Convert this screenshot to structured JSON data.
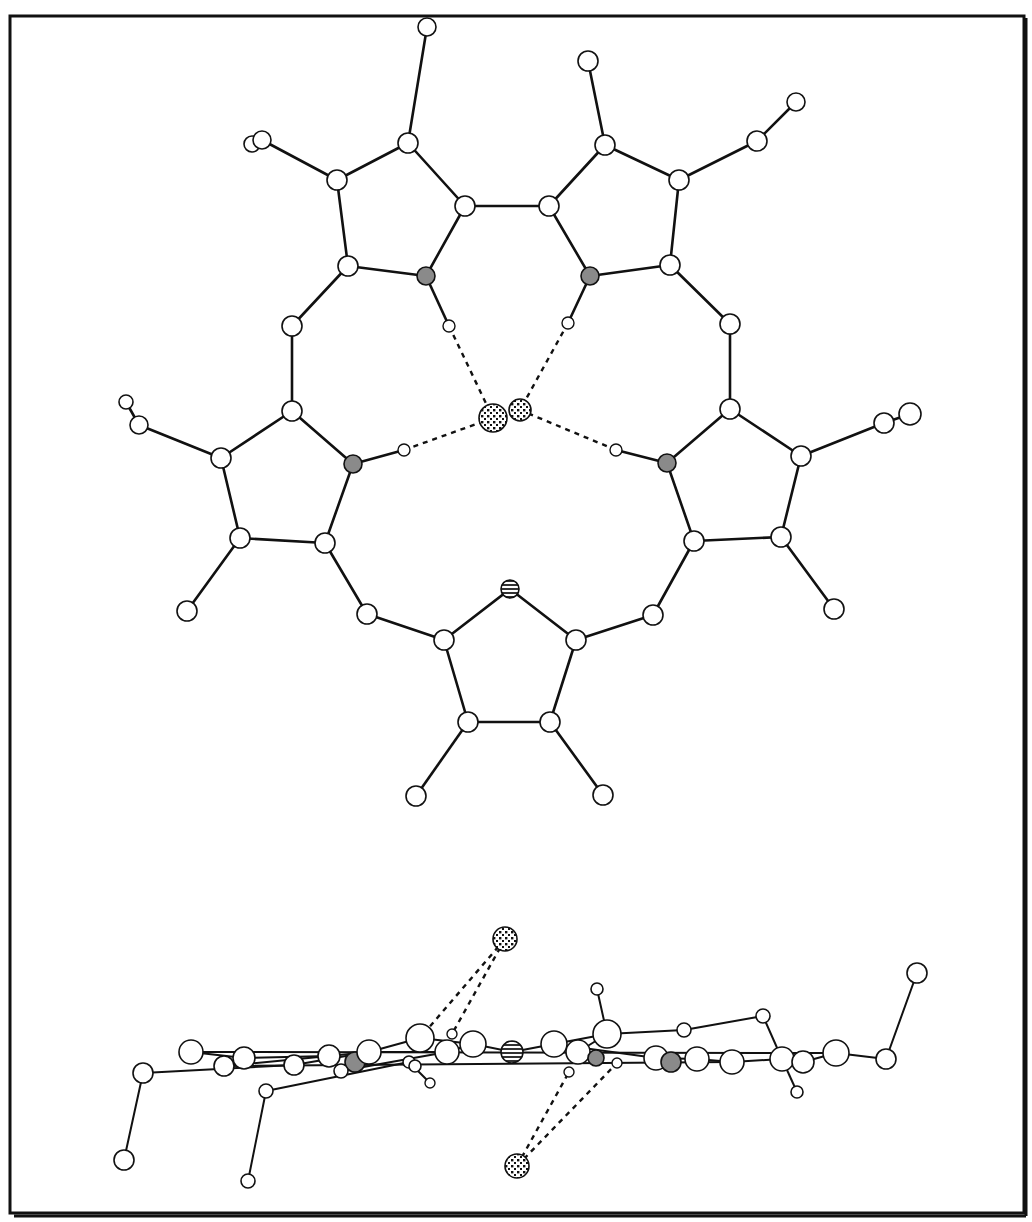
{
  "figure": {
    "title": "",
    "colors": {
      "background": "#ffffff",
      "line": "#111111",
      "nitrogen_fill": "#8a8a8a",
      "carbon_fill": "#ffffff"
    },
    "legend": {
      "atom_types": [
        {
          "key": "C",
          "style": "open circle"
        },
        {
          "key": "H",
          "style": "small open circle"
        },
        {
          "key": "N",
          "style": "grey filled circle"
        },
        {
          "key": "S",
          "style": "horizontal hatched circle"
        },
        {
          "key": "X",
          "style": "dotted circle (anion)"
        }
      ]
    }
  },
  "views": {
    "top": {
      "label": "top view",
      "atoms": [
        {
          "id": "a1",
          "t": "C",
          "x": 427,
          "y": 27,
          "r": 9
        },
        {
          "id": "a2",
          "t": "C",
          "x": 252,
          "y": 144,
          "r": 8
        },
        {
          "id": "a3",
          "t": "C",
          "x": 262,
          "y": 140,
          "r": 9
        },
        {
          "id": "a4",
          "t": "C",
          "x": 408,
          "y": 143,
          "r": 10
        },
        {
          "id": "a5",
          "t": "C",
          "x": 337,
          "y": 180,
          "r": 10
        },
        {
          "id": "a6",
          "t": "C",
          "x": 465,
          "y": 206,
          "r": 10
        },
        {
          "id": "a7",
          "t": "C",
          "x": 348,
          "y": 266,
          "r": 10
        },
        {
          "id": "a8",
          "t": "N",
          "x": 426,
          "y": 276,
          "r": 9
        },
        {
          "id": "a9",
          "t": "H",
          "x": 449,
          "y": 326,
          "r": 6
        },
        {
          "id": "b1",
          "t": "C",
          "x": 588,
          "y": 61,
          "r": 10
        },
        {
          "id": "b2",
          "t": "C",
          "x": 605,
          "y": 145,
          "r": 10
        },
        {
          "id": "b3",
          "t": "C",
          "x": 679,
          "y": 180,
          "r": 10
        },
        {
          "id": "b4",
          "t": "C",
          "x": 757,
          "y": 141,
          "r": 10
        },
        {
          "id": "b5",
          "t": "C",
          "x": 796,
          "y": 102,
          "r": 9
        },
        {
          "id": "b6",
          "t": "C",
          "x": 549,
          "y": 206,
          "r": 10
        },
        {
          "id": "b7",
          "t": "C",
          "x": 670,
          "y": 265,
          "r": 10
        },
        {
          "id": "b8",
          "t": "N",
          "x": 590,
          "y": 276,
          "r": 9
        },
        {
          "id": "b9",
          "t": "H",
          "x": 568,
          "y": 323,
          "r": 6
        },
        {
          "id": "c1",
          "t": "C",
          "x": 292,
          "y": 326,
          "r": 10
        },
        {
          "id": "c2",
          "t": "C",
          "x": 292,
          "y": 411,
          "r": 10
        },
        {
          "id": "c3",
          "t": "C",
          "x": 221,
          "y": 458,
          "r": 10
        },
        {
          "id": "c4",
          "t": "C",
          "x": 139,
          "y": 425,
          "r": 9
        },
        {
          "id": "c5",
          "t": "C",
          "x": 126,
          "y": 402,
          "r": 7
        },
        {
          "id": "c6",
          "t": "N",
          "x": 353,
          "y": 464,
          "r": 9
        },
        {
          "id": "c7",
          "t": "H",
          "x": 404,
          "y": 450,
          "r": 6
        },
        {
          "id": "c8",
          "t": "C",
          "x": 240,
          "y": 538,
          "r": 10
        },
        {
          "id": "c9",
          "t": "C",
          "x": 325,
          "y": 543,
          "r": 10
        },
        {
          "id": "c10",
          "t": "C",
          "x": 187,
          "y": 611,
          "r": 10
        },
        {
          "id": "c11",
          "t": "C",
          "x": 367,
          "y": 614,
          "r": 10
        },
        {
          "id": "d1",
          "t": "C",
          "x": 730,
          "y": 324,
          "r": 10
        },
        {
          "id": "d2",
          "t": "C",
          "x": 730,
          "y": 409,
          "r": 10
        },
        {
          "id": "d3",
          "t": "C",
          "x": 801,
          "y": 456,
          "r": 10
        },
        {
          "id": "d4",
          "t": "C",
          "x": 884,
          "y": 423,
          "r": 10
        },
        {
          "id": "d5",
          "t": "C",
          "x": 910,
          "y": 414,
          "r": 11
        },
        {
          "id": "d6",
          "t": "N",
          "x": 667,
          "y": 463,
          "r": 9
        },
        {
          "id": "d7",
          "t": "H",
          "x": 616,
          "y": 450,
          "r": 6
        },
        {
          "id": "d8",
          "t": "C",
          "x": 694,
          "y": 541,
          "r": 10
        },
        {
          "id": "d9",
          "t": "C",
          "x": 781,
          "y": 537,
          "r": 10
        },
        {
          "id": "d10",
          "t": "C",
          "x": 834,
          "y": 609,
          "r": 10
        },
        {
          "id": "d11",
          "t": "C",
          "x": 653,
          "y": 615,
          "r": 10
        },
        {
          "id": "e1",
          "t": "S",
          "x": 510,
          "y": 589,
          "r": 9
        },
        {
          "id": "e2",
          "t": "C",
          "x": 444,
          "y": 640,
          "r": 10
        },
        {
          "id": "e3",
          "t": "C",
          "x": 576,
          "y": 640,
          "r": 10
        },
        {
          "id": "e4",
          "t": "C",
          "x": 468,
          "y": 722,
          "r": 10
        },
        {
          "id": "e5",
          "t": "C",
          "x": 550,
          "y": 722,
          "r": 10
        },
        {
          "id": "e6",
          "t": "C",
          "x": 416,
          "y": 796,
          "r": 10
        },
        {
          "id": "e7",
          "t": "C",
          "x": 603,
          "y": 795,
          "r": 10
        },
        {
          "id": "x1",
          "t": "X",
          "x": 493,
          "y": 418,
          "r": 14
        },
        {
          "id": "x2",
          "t": "X",
          "x": 520,
          "y": 410,
          "r": 11
        }
      ],
      "bonds": [
        [
          "a1",
          "a4"
        ],
        [
          "a2",
          "a3"
        ],
        [
          "a3",
          "a5"
        ],
        [
          "a4",
          "a5"
        ],
        [
          "a4",
          "a6"
        ],
        [
          "a5",
          "a7"
        ],
        [
          "a7",
          "a8"
        ],
        [
          "a8",
          "a6"
        ],
        [
          "a8",
          "a9"
        ],
        [
          "a6",
          "b6"
        ],
        [
          "b1",
          "b2"
        ],
        [
          "b2",
          "b6"
        ],
        [
          "b2",
          "b3"
        ],
        [
          "b3",
          "b4"
        ],
        [
          "b4",
          "b5"
        ],
        [
          "b3",
          "b7"
        ],
        [
          "b7",
          "b8"
        ],
        [
          "b8",
          "b6"
        ],
        [
          "b8",
          "b9"
        ],
        [
          "a7",
          "c1"
        ],
        [
          "c1",
          "c2"
        ],
        [
          "c2",
          "c3"
        ],
        [
          "c3",
          "c4"
        ],
        [
          "c4",
          "c5"
        ],
        [
          "c2",
          "c6"
        ],
        [
          "c6",
          "c7"
        ],
        [
          "c3",
          "c8"
        ],
        [
          "c8",
          "c9"
        ],
        [
          "c9",
          "c6"
        ],
        [
          "c8",
          "c10"
        ],
        [
          "c9",
          "c11"
        ],
        [
          "b7",
          "d1"
        ],
        [
          "d1",
          "d2"
        ],
        [
          "d2",
          "d3"
        ],
        [
          "d3",
          "d4"
        ],
        [
          "d4",
          "d5"
        ],
        [
          "d2",
          "d6"
        ],
        [
          "d6",
          "d7"
        ],
        [
          "d3",
          "d9"
        ],
        [
          "d9",
          "d8"
        ],
        [
          "d8",
          "d6"
        ],
        [
          "d9",
          "d10"
        ],
        [
          "d8",
          "d11"
        ],
        [
          "c11",
          "e2"
        ],
        [
          "d11",
          "e3"
        ],
        [
          "e1",
          "e2"
        ],
        [
          "e1",
          "e3"
        ],
        [
          "e2",
          "e4"
        ],
        [
          "e3",
          "e5"
        ],
        [
          "e4",
          "e5"
        ],
        [
          "e4",
          "e6"
        ],
        [
          "e5",
          "e7"
        ]
      ],
      "hbonds": [
        [
          "a9",
          "x1"
        ],
        [
          "b9",
          "x2"
        ],
        [
          "c7",
          "x1"
        ],
        [
          "d7",
          "x2"
        ]
      ]
    },
    "side": {
      "label": "side view",
      "atoms": [
        {
          "id": "s1",
          "t": "C",
          "x": 124,
          "y": 1160,
          "r": 10
        },
        {
          "id": "s2",
          "t": "C",
          "x": 143,
          "y": 1073,
          "r": 10
        },
        {
          "id": "s3",
          "t": "C",
          "x": 191,
          "y": 1052,
          "r": 12
        },
        {
          "id": "s4",
          "t": "C",
          "x": 224,
          "y": 1066,
          "r": 10
        },
        {
          "id": "s5",
          "t": "C",
          "x": 244,
          "y": 1058,
          "r": 11
        },
        {
          "id": "s6",
          "t": "C",
          "x": 294,
          "y": 1065,
          "r": 10
        },
        {
          "id": "s7",
          "t": "C",
          "x": 329,
          "y": 1056,
          "r": 11
        },
        {
          "id": "s8",
          "t": "N",
          "x": 355,
          "y": 1062,
          "r": 10
        },
        {
          "id": "s9",
          "t": "C",
          "x": 369,
          "y": 1052,
          "r": 12
        },
        {
          "id": "s10",
          "t": "C",
          "x": 341,
          "y": 1071,
          "r": 7
        },
        {
          "id": "s11",
          "t": "C",
          "x": 266,
          "y": 1091,
          "r": 7
        },
        {
          "id": "s12",
          "t": "C",
          "x": 248,
          "y": 1181,
          "r": 7
        },
        {
          "id": "s13",
          "t": "C",
          "x": 420,
          "y": 1038,
          "r": 14
        },
        {
          "id": "s14",
          "t": "C",
          "x": 447,
          "y": 1052,
          "r": 12
        },
        {
          "id": "s15",
          "t": "C",
          "x": 473,
          "y": 1044,
          "r": 13
        },
        {
          "id": "s16",
          "t": "H",
          "x": 452,
          "y": 1034,
          "r": 5
        },
        {
          "id": "s17",
          "t": "C",
          "x": 409,
          "y": 1062,
          "r": 6
        },
        {
          "id": "s18",
          "t": "C",
          "x": 415,
          "y": 1066,
          "r": 6
        },
        {
          "id": "s19",
          "t": "H",
          "x": 430,
          "y": 1083,
          "r": 5
        },
        {
          "id": "s20",
          "t": "S",
          "x": 512,
          "y": 1052,
          "r": 11
        },
        {
          "id": "s21",
          "t": "C",
          "x": 554,
          "y": 1044,
          "r": 13
        },
        {
          "id": "s22",
          "t": "C",
          "x": 578,
          "y": 1052,
          "r": 12
        },
        {
          "id": "s23",
          "t": "C",
          "x": 607,
          "y": 1034,
          "r": 14
        },
        {
          "id": "s24",
          "t": "N",
          "x": 596,
          "y": 1058,
          "r": 8
        },
        {
          "id": "s25",
          "t": "H",
          "x": 569,
          "y": 1072,
          "r": 5
        },
        {
          "id": "s26",
          "t": "H",
          "x": 617,
          "y": 1063,
          "r": 5
        },
        {
          "id": "s27",
          "t": "C",
          "x": 597,
          "y": 989,
          "r": 6
        },
        {
          "id": "s28",
          "t": "C",
          "x": 684,
          "y": 1030,
          "r": 7
        },
        {
          "id": "s29",
          "t": "C",
          "x": 656,
          "y": 1058,
          "r": 12
        },
        {
          "id": "s30",
          "t": "N",
          "x": 671,
          "y": 1062,
          "r": 10
        },
        {
          "id": "s31",
          "t": "C",
          "x": 697,
          "y": 1059,
          "r": 12
        },
        {
          "id": "s32",
          "t": "C",
          "x": 732,
          "y": 1062,
          "r": 12
        },
        {
          "id": "s33",
          "t": "C",
          "x": 763,
          "y": 1016,
          "r": 7
        },
        {
          "id": "s34",
          "t": "C",
          "x": 782,
          "y": 1059,
          "r": 12
        },
        {
          "id": "s35",
          "t": "C",
          "x": 803,
          "y": 1062,
          "r": 11
        },
        {
          "id": "s36",
          "t": "C",
          "x": 797,
          "y": 1092,
          "r": 6
        },
        {
          "id": "s37",
          "t": "C",
          "x": 836,
          "y": 1053,
          "r": 13
        },
        {
          "id": "s38",
          "t": "C",
          "x": 886,
          "y": 1059,
          "r": 10
        },
        {
          "id": "s39",
          "t": "C",
          "x": 917,
          "y": 973,
          "r": 10
        },
        {
          "id": "x3",
          "t": "X",
          "x": 505,
          "y": 939,
          "r": 12
        },
        {
          "id": "x4",
          "t": "X",
          "x": 517,
          "y": 1166,
          "r": 12
        }
      ],
      "bonds": [
        [
          "s1",
          "s2"
        ],
        [
          "s2",
          "s6"
        ],
        [
          "s3",
          "s5"
        ],
        [
          "s4",
          "s7"
        ],
        [
          "s5",
          "s7"
        ],
        [
          "s6",
          "s9"
        ],
        [
          "s7",
          "s9"
        ],
        [
          "s9",
          "s13"
        ],
        [
          "s9",
          "s14"
        ],
        [
          "s10",
          "s14"
        ],
        [
          "s11",
          "s12"
        ],
        [
          "s11",
          "s17"
        ],
        [
          "s13",
          "s15"
        ],
        [
          "s14",
          "s15"
        ],
        [
          "s15",
          "s20"
        ],
        [
          "s20",
          "s21"
        ],
        [
          "s17",
          "s19"
        ],
        [
          "s21",
          "s23"
        ],
        [
          "s21",
          "s29"
        ],
        [
          "s22",
          "s23"
        ],
        [
          "s23",
          "s27"
        ],
        [
          "s23",
          "s28"
        ],
        [
          "s28",
          "s33"
        ],
        [
          "s33",
          "s34"
        ],
        [
          "s29",
          "s31"
        ],
        [
          "s31",
          "s32"
        ],
        [
          "s32",
          "s34"
        ],
        [
          "s34",
          "s35"
        ],
        [
          "s35",
          "s37"
        ],
        [
          "s34",
          "s36"
        ],
        [
          "s37",
          "s38"
        ],
        [
          "s38",
          "s39"
        ],
        [
          "s3",
          "s37"
        ],
        [
          "s4",
          "s32"
        ]
      ],
      "hbonds": [
        [
          "x3",
          "s13"
        ],
        [
          "x3",
          "s16"
        ],
        [
          "x4",
          "s25"
        ],
        [
          "x4",
          "s26"
        ]
      ]
    }
  }
}
